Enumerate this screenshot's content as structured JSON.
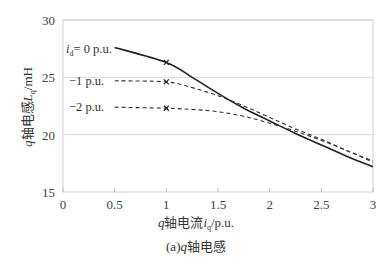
{
  "chart_data": {
    "type": "line",
    "title": "",
    "caption": "(a)q轴电感",
    "xlabel": "q轴电流i_q/p.u.",
    "ylabel": "q轴电感L_q/mH",
    "xlim": [
      0,
      3
    ],
    "ylim": [
      15,
      30
    ],
    "x_ticks": [
      "0",
      "0.5",
      "1",
      "1.5",
      "2",
      "2.5",
      "3"
    ],
    "y_ticks": [
      "15",
      "20",
      "25",
      "30"
    ],
    "grid": "horizontal",
    "legend": "inline labels",
    "series": [
      {
        "name": "i_d = 0 p.u.",
        "style": "solid",
        "x": [
          0.5,
          1.0,
          1.25,
          1.5,
          1.75,
          2.0,
          2.25,
          2.5,
          2.75,
          3.0
        ],
        "y": [
          27.6,
          26.3,
          25.0,
          23.6,
          22.3,
          21.2,
          20.1,
          19.1,
          18.1,
          17.2
        ],
        "marker_at": 1.0
      },
      {
        "name": "-1 p.u.",
        "style": "dashed",
        "x": [
          0.5,
          1.0,
          1.25,
          1.5,
          1.75,
          2.0,
          2.25,
          2.5,
          2.75,
          3.0
        ],
        "y": [
          24.7,
          24.6,
          24.1,
          23.4,
          22.5,
          21.5,
          20.5,
          19.6,
          18.6,
          17.7
        ],
        "marker_at": 1.0
      },
      {
        "name": "-2 p.u.",
        "style": "dashed",
        "x": [
          0.5,
          1.0,
          1.25,
          1.5,
          1.75,
          2.0,
          2.25,
          2.5,
          2.75,
          3.0
        ],
        "y": [
          22.4,
          22.3,
          22.2,
          22.0,
          21.6,
          21.0,
          20.3,
          19.5,
          18.6,
          17.6
        ],
        "marker_at": 1.0
      }
    ]
  },
  "labels": {
    "series0_prefix": "i",
    "series0_sub": "d",
    "series0_suffix": "= 0 p.u.",
    "series1": "−1 p.u.",
    "series2": "−2 p.u.",
    "x_title_var": "q",
    "x_title_mid": "轴电流",
    "x_title_sym": "i",
    "x_title_sub": "q",
    "x_title_unit": "/p.u.",
    "y_title_var": "q",
    "y_title_mid": "轴电感",
    "y_title_sym": "L",
    "y_title_sub": "q",
    "y_title_unit": "/mH",
    "caption_pre": "(a)",
    "caption_var": "q",
    "caption_post": "轴电感"
  }
}
